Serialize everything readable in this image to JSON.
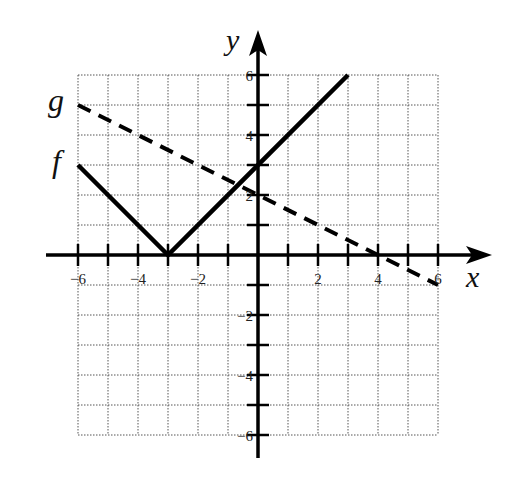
{
  "chart_data": {
    "type": "line",
    "title": "",
    "xlabel": "x",
    "ylabel": "y",
    "xlim": [
      -6,
      6
    ],
    "ylim": [
      -6,
      6
    ],
    "grid": true,
    "grid_style": "dotted",
    "x_ticks": [
      -6,
      -5,
      -4,
      -3,
      -2,
      -1,
      1,
      2,
      3,
      4,
      5,
      6
    ],
    "y_ticks": [
      -6,
      -5,
      -4,
      -3,
      -2,
      -1,
      1,
      2,
      3,
      4,
      5,
      6
    ],
    "x_tick_labels": [
      "-6",
      "-4",
      "-2",
      "2",
      "4",
      "6"
    ],
    "y_tick_labels": [
      "6",
      "4",
      "2",
      "-2",
      "-4",
      "-6"
    ],
    "series": [
      {
        "name": "f",
        "style": "solid",
        "color": "#000000",
        "expression": "f(x) = |x + 3|",
        "points": [
          [
            -6,
            3
          ],
          [
            -3,
            0
          ],
          [
            3,
            6
          ]
        ]
      },
      {
        "name": "g",
        "style": "dashed",
        "color": "#000000",
        "expression": "g(x) = -x/2 + 2",
        "points": [
          [
            -6,
            5
          ],
          [
            6,
            -1
          ]
        ]
      }
    ],
    "legend": {
      "position": "left-of-plot",
      "entries": [
        {
          "label": "g",
          "y": 5
        },
        {
          "label": "f",
          "y": 3
        }
      ]
    }
  },
  "labels": {
    "x_axis": "x",
    "y_axis": "y",
    "f_label": "f",
    "g_label": "g",
    "x_ticks": [
      "−6",
      "−4",
      "−2",
      "2",
      "4",
      "6"
    ],
    "y_ticks": [
      "6",
      "4",
      "2",
      "−2",
      "−4",
      "−6"
    ]
  }
}
